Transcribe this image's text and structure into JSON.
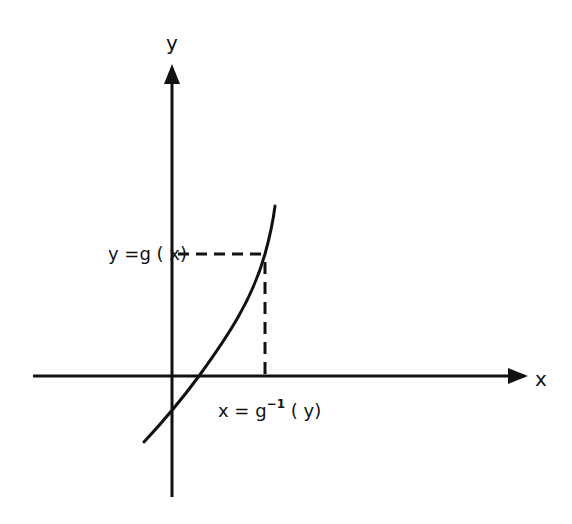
{
  "diagram": {
    "title": "",
    "colors": {
      "ink": "#111111",
      "background": "#ffffff"
    },
    "axes": {
      "x_label": "x",
      "y_label": "y"
    },
    "curve": {
      "name": "g",
      "description": "monotonically increasing function g(x)"
    },
    "annotations": {
      "y_value_label": "y =g ( x)",
      "x_value_prefix": "x = g",
      "x_value_superscript": "−1",
      "x_value_suffix": " ( y)"
    }
  }
}
